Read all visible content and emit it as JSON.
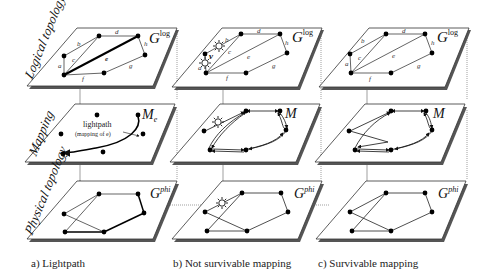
{
  "row_labels": {
    "logical": "Logical topology",
    "mapping": "Mapping",
    "physical": "Physical topology"
  },
  "captions": {
    "a": "a) Lightpath",
    "b": "b) Not survivable mapping",
    "c": "c) Survivable mapping"
  },
  "plane_labels": {
    "logical": "G",
    "logical_sup": "log",
    "mapping_a": "M",
    "mapping_a_sub": "e",
    "mapping": "M",
    "physical": "G",
    "physical_sup": "phi"
  },
  "edge_labels": [
    "a",
    "b",
    "c",
    "d",
    "e",
    "f",
    "g",
    "h"
  ],
  "annotations": {
    "lightpath": "lightpath",
    "lightpath_sub": "(mapping of e)",
    "node_v": "v"
  },
  "colors": {
    "plane_fill": "#ffffff",
    "plane_stroke": "#333333",
    "plane_shadow": "#555555",
    "node": "#000000",
    "edge": "#222222",
    "connector": "#666666"
  }
}
